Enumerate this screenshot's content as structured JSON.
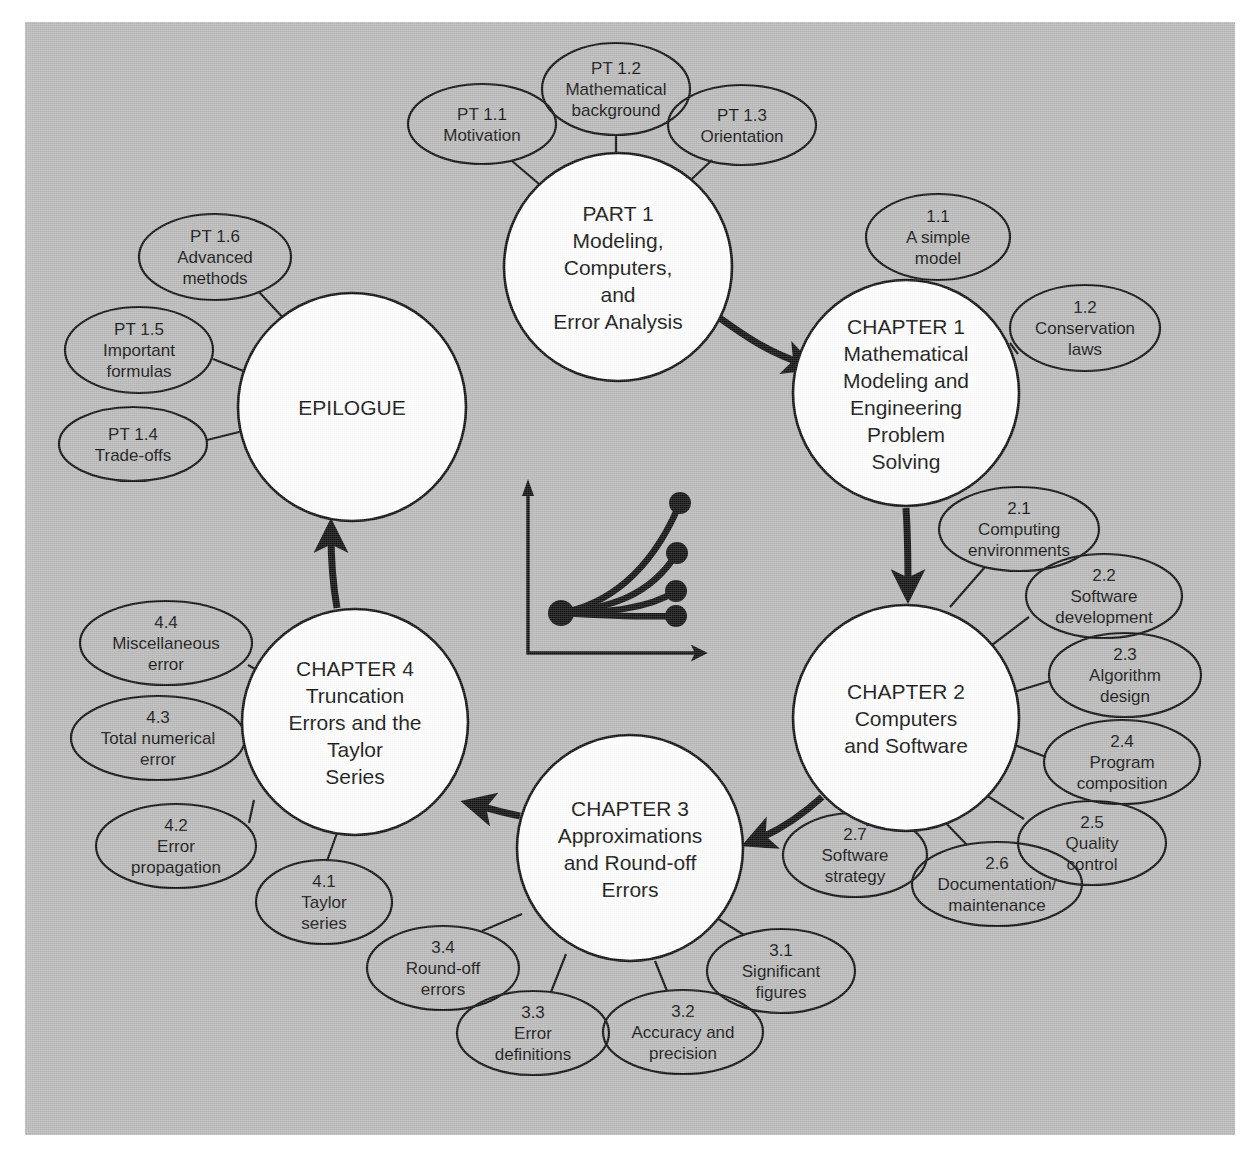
{
  "figure": {
    "background_color": "#b9b9b9",
    "node_fill": "#ffffff",
    "line_color": "#101010"
  },
  "nodes": [
    {
      "id": "part1",
      "name": "part-1",
      "lines": [
        "PART 1",
        "Modeling,",
        "Computers,",
        "and",
        "Error Analysis"
      ],
      "cx": 618,
      "cy": 267,
      "r": 114
    },
    {
      "id": "chapter1",
      "name": "chapter-1",
      "lines": [
        "CHAPTER 1",
        "Mathematical",
        "Modeling and",
        "Engineering",
        "Problem",
        "Solving"
      ],
      "cx": 906,
      "cy": 393,
      "r": 113
    },
    {
      "id": "chapter2",
      "name": "chapter-2",
      "lines": [
        "CHAPTER 2",
        "Computers",
        "and Software"
      ],
      "cx": 906,
      "cy": 718,
      "r": 113
    },
    {
      "id": "chapter3",
      "name": "chapter-3",
      "lines": [
        "CHAPTER 3",
        "Approximations",
        "and Round-off",
        "Errors"
      ],
      "cx": 630,
      "cy": 848,
      "r": 113
    },
    {
      "id": "chapter4",
      "name": "chapter-4",
      "lines": [
        "CHAPTER 4",
        "Truncation",
        "Errors and the",
        "Taylor",
        "Series"
      ],
      "cx": 355,
      "cy": 722,
      "r": 113
    },
    {
      "id": "epilogue",
      "name": "epilogue",
      "lines": [
        "EPILOGUE"
      ],
      "cx": 352,
      "cy": 407,
      "r": 114
    }
  ],
  "satellites": [
    {
      "id": "pt11",
      "name": "pt-1-1",
      "lines": [
        "PT 1.1",
        "Motivation"
      ],
      "cx": 482,
      "cy": 124,
      "rx": 74,
      "ry": 40,
      "spoke": [
        [
          512,
          161
        ],
        [
          552,
          195
        ]
      ]
    },
    {
      "id": "pt12",
      "name": "pt-1-2",
      "lines": [
        "PT 1.2",
        "Mathematical",
        "background"
      ],
      "cx": 616,
      "cy": 89,
      "rx": 74,
      "ry": 46,
      "spoke": [
        [
          616,
          135
        ],
        [
          616,
          171
        ]
      ]
    },
    {
      "id": "pt13",
      "name": "pt-1-3",
      "lines": [
        "PT 1.3",
        "Orientation"
      ],
      "cx": 742,
      "cy": 125,
      "rx": 74,
      "ry": 40,
      "spoke": [
        [
          712,
          160
        ],
        [
          678,
          192
        ]
      ]
    },
    {
      "id": "pt14",
      "name": "pt-1-4",
      "lines": [
        "PT 1.4",
        "Trade-offs"
      ],
      "cx": 133,
      "cy": 444,
      "rx": 74,
      "ry": 37,
      "spoke": [
        [
          207,
          440
        ],
        [
          243,
          431
        ]
      ]
    },
    {
      "id": "pt15",
      "name": "pt-1-5",
      "lines": [
        "PT 1.5",
        "Important",
        "formulas"
      ],
      "cx": 139,
      "cy": 350,
      "rx": 74,
      "ry": 43,
      "spoke": [
        [
          213,
          359
        ],
        [
          246,
          372
        ]
      ]
    },
    {
      "id": "pt16",
      "name": "pt-1-6",
      "lines": [
        "PT 1.6",
        "Advanced",
        "methods"
      ],
      "cx": 215,
      "cy": 257,
      "rx": 76,
      "ry": 43,
      "spoke": [
        [
          259,
          292
        ],
        [
          287,
          322
        ]
      ]
    },
    {
      "id": "s11",
      "name": "section-1-1",
      "lines": [
        "1.1",
        "A simple",
        "model"
      ],
      "cx": 938,
      "cy": 237,
      "rx": 72,
      "ry": 43,
      "spoke": [
        [
          912,
          279
        ],
        [
          886,
          315
        ]
      ]
    },
    {
      "id": "s12",
      "name": "section-1-2",
      "lines": [
        "1.2",
        "Conservation",
        "laws"
      ],
      "cx": 1085,
      "cy": 328,
      "rx": 75,
      "ry": 43,
      "spoke": [
        [
          1010,
          343
        ],
        [
          1018,
          354
        ]
      ]
    },
    {
      "id": "s21",
      "name": "section-2-1",
      "lines": [
        "2.1",
        "Computing",
        "environments"
      ],
      "cx": 1019,
      "cy": 529,
      "rx": 80,
      "ry": 42,
      "spoke": [
        [
          985,
          567
        ],
        [
          950,
          607
        ]
      ]
    },
    {
      "id": "s22",
      "name": "section-2-2",
      "lines": [
        "2.2",
        "Software",
        "development"
      ],
      "cx": 1104,
      "cy": 596,
      "rx": 78,
      "ry": 42,
      "spoke": [
        [
          1029,
          617
        ],
        [
          988,
          648
        ]
      ]
    },
    {
      "id": "s23",
      "name": "section-2-3",
      "lines": [
        "2.3",
        "Algorithm",
        "design",
        ""
      ],
      "cx": 1125,
      "cy": 675,
      "rx": 76,
      "ry": 42,
      "spoke": [
        [
          1050,
          681
        ],
        [
          1014,
          692
        ]
      ]
    },
    {
      "id": "s24",
      "name": "section-2-4",
      "lines": [
        "2.4",
        "Program",
        "composition"
      ],
      "cx": 1122,
      "cy": 762,
      "rx": 78,
      "ry": 42,
      "spoke": [
        [
          1046,
          757
        ],
        [
          1012,
          744
        ]
      ]
    },
    {
      "id": "s25",
      "name": "section-2-5",
      "lines": [
        "2.5",
        "Quality",
        "control"
      ],
      "cx": 1092,
      "cy": 843,
      "rx": 74,
      "ry": 42,
      "spoke": [
        [
          1024,
          819
        ],
        [
          986,
          795
        ]
      ]
    },
    {
      "id": "s26",
      "name": "section-2-6",
      "lines": [
        "2.6",
        "Documentation/",
        "maintenance"
      ],
      "cx": 997,
      "cy": 884,
      "rx": 85,
      "ry": 42,
      "spoke": [
        [
          967,
          845
        ],
        [
          941,
          818
        ]
      ]
    },
    {
      "id": "s27",
      "name": "section-2-7",
      "lines": [
        "2.7",
        "Software",
        "strategy"
      ],
      "cx": 855,
      "cy": 855,
      "rx": 72,
      "ry": 42,
      "spoke": [
        [
          860,
          814
        ],
        [
          868,
          826
        ]
      ]
    },
    {
      "id": "s31",
      "name": "section-3-1",
      "lines": [
        "3.1",
        "Significant",
        "figures"
      ],
      "cx": 781,
      "cy": 971,
      "rx": 74,
      "ry": 42,
      "spoke": [
        [
          744,
          935
        ],
        [
          712,
          915
        ]
      ]
    },
    {
      "id": "s32",
      "name": "section-3-2",
      "lines": [
        "3.2",
        "Accuracy and",
        "precision"
      ],
      "cx": 683,
      "cy": 1032,
      "rx": 80,
      "ry": 42,
      "spoke": [
        [
          667,
          991
        ],
        [
          655,
          961
        ]
      ]
    },
    {
      "id": "s33",
      "name": "section-3-3",
      "lines": [
        "3.3",
        "Error",
        "definitions"
      ],
      "cx": 533,
      "cy": 1033,
      "rx": 76,
      "ry": 42,
      "spoke": [
        [
          551,
          992
        ],
        [
          566,
          954
        ]
      ]
    },
    {
      "id": "s34",
      "name": "section-3-4",
      "lines": [
        "3.4",
        "Round-off",
        "errors"
      ],
      "cx": 443,
      "cy": 968,
      "rx": 76,
      "ry": 42,
      "spoke": [
        [
          482,
          931
        ],
        [
          522,
          914
        ]
      ]
    },
    {
      "id": "s41",
      "name": "section-4-1",
      "lines": [
        "4.1",
        "Taylor",
        "series"
      ],
      "cx": 324,
      "cy": 902,
      "rx": 68,
      "ry": 42,
      "spoke": [
        [
          327,
          861
        ],
        [
          337,
          833
        ]
      ]
    },
    {
      "id": "s42",
      "name": "section-4-2",
      "lines": [
        "4.2",
        "Error",
        "propagation"
      ],
      "cx": 176,
      "cy": 846,
      "rx": 80,
      "ry": 42,
      "spoke": [
        [
          249,
          823
        ],
        [
          254,
          800
        ]
      ]
    },
    {
      "id": "s43",
      "name": "section-4-3",
      "lines": [
        "4.3",
        "Total numerical",
        "error"
      ],
      "cx": 158,
      "cy": 738,
      "rx": 87,
      "ry": 42,
      "spoke": [
        [
          245,
          733
        ],
        [
          242,
          729
        ]
      ]
    },
    {
      "id": "s44",
      "name": "section-4-4",
      "lines": [
        "4.4",
        "Miscellaneous",
        "error"
      ],
      "cx": 166,
      "cy": 643,
      "rx": 86,
      "ry": 42,
      "spoke": [
        [
          248,
          665
        ],
        [
          262,
          673
        ]
      ]
    }
  ],
  "flows": [
    {
      "id": "f1",
      "name": "flow-part1-to-chapter1",
      "from": "part1",
      "to": "chapter1",
      "path": "M 706,308 C 752,342 770,352 803,364"
    },
    {
      "id": "f2",
      "name": "flow-chapter1-to-chapter2",
      "from": "chapter1",
      "to": "chapter2",
      "path": "M 906,508 C 908,540 908,565 908,588"
    },
    {
      "id": "f3",
      "name": "flow-chapter2-to-chapter3",
      "from": "chapter2",
      "to": "chapter3",
      "path": "M 822,797 C 800,817 780,830 756,840"
    },
    {
      "id": "f4",
      "name": "flow-chapter3-to-chapter4",
      "from": "chapter3",
      "to": "chapter4",
      "path": "M 520,816 C 500,812 488,808 476,805"
    },
    {
      "id": "f5",
      "name": "flow-chapter4-to-epilogue",
      "from": "chapter4",
      "to": "epilogue",
      "path": "M 337,608 C 333,585 331,560 331,534"
    }
  ],
  "center_icon": {
    "name": "convergence-plot-icon",
    "description": "small plot with four curves fanning from a common origin point",
    "origin": {
      "x": 561,
      "y": 613
    },
    "axis": {
      "x_start": 528,
      "y_start": 490,
      "x_corner": 528,
      "y_corner": 653,
      "x_end": 700,
      "y_end": 653
    },
    "curves": [
      {
        "path": "M 561,613 C 605,605 650,575 680,503",
        "end_x": 680,
        "end_y": 503
      },
      {
        "path": "M 561,613 C 608,608 650,597 677,553",
        "end_x": 677,
        "end_y": 553
      },
      {
        "path": "M 561,613 C 610,612 648,609 676,591",
        "end_x": 676,
        "end_y": 591
      },
      {
        "path": "M 561,613 C 612,616 650,617 676,616",
        "end_x": 676,
        "end_y": 616
      }
    ]
  }
}
